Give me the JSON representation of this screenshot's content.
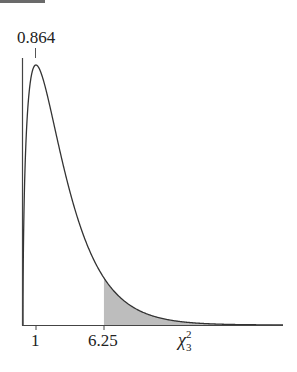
{
  "chart_data": {
    "type": "area",
    "title": "",
    "xlabel": "χ²₃",
    "ylabel": "",
    "distribution": "chi-square, 3 degrees of freedom (density)",
    "annotations": [
      {
        "label": "0.864",
        "x": 1,
        "note": "value marked at the peak (mode) of the curve"
      }
    ],
    "x_ticks": [
      1,
      6.25
    ],
    "x_tick_labels": [
      "1",
      "6.25"
    ],
    "shaded_region": {
      "from": 6.25,
      "to": "right tail",
      "color": "#bdbdbd"
    },
    "xlim": [
      0,
      20
    ],
    "grid": false,
    "legend": null,
    "series": [
      {
        "name": "chi-square density df=3",
        "x": [
          0,
          0.25,
          0.5,
          1,
          1.5,
          2,
          3,
          4,
          5,
          6.25,
          8,
          10,
          12,
          15,
          20
        ],
        "values": [
          0,
          0.176,
          0.22,
          0.242,
          0.231,
          0.208,
          0.154,
          0.108,
          0.073,
          0.04,
          0.021,
          0.008,
          0.003,
          0.001,
          0.0
        ]
      }
    ]
  },
  "labels": {
    "peak": "0.864",
    "tick_1": "1",
    "tick_625": "6.25",
    "xaxis_symbol": "χ",
    "xaxis_sup": "2",
    "xaxis_sub": "3"
  }
}
